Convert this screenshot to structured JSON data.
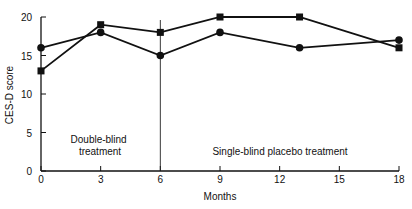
{
  "chart_data": {
    "type": "line",
    "title": "",
    "xlabel": "Months",
    "ylabel": "CES-D score",
    "xlim": [
      0,
      18
    ],
    "ylim": [
      0,
      20
    ],
    "x_ticks": [
      "0",
      "3",
      "6",
      "9",
      "12",
      "15",
      "18"
    ],
    "y_ticks": [
      "0",
      "5",
      "10",
      "15",
      "20"
    ],
    "grid": false,
    "legend": null,
    "series": [
      {
        "name": "Squares",
        "marker": "square",
        "x": [
          0,
          3,
          6,
          9,
          13,
          18
        ],
        "values": [
          13,
          19,
          18,
          20,
          20,
          16
        ]
      },
      {
        "name": "Circles",
        "marker": "circle",
        "x": [
          0,
          3,
          6,
          9,
          13,
          18
        ],
        "values": [
          16,
          18,
          15,
          18,
          16,
          17
        ]
      }
    ],
    "annotations": [
      {
        "text": "Double-blind treatment",
        "lines": [
          "Double-blind",
          "treatment"
        ]
      },
      {
        "text": "Single-blind placebo treatment"
      }
    ],
    "divider_at_month": 6
  }
}
